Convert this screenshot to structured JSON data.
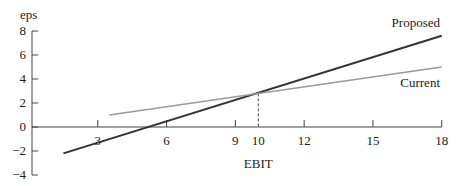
{
  "chart_data": {
    "type": "line",
    "title": "",
    "xlabel": "EBIT",
    "ylabel": "eps",
    "xlim": [
      0,
      18
    ],
    "ylim": [
      -4,
      8
    ],
    "xticks": [
      3,
      6,
      9,
      10,
      12,
      15,
      18
    ],
    "yticks": [
      -4,
      -2,
      0,
      2,
      4,
      6,
      8
    ],
    "grid": false,
    "series": [
      {
        "name": "Proposed",
        "color": "#333333",
        "x": [
          1.5,
          18
        ],
        "y": [
          -2.2,
          7.6
        ]
      },
      {
        "name": "Current",
        "color": "#9a9a9a",
        "x": [
          3.5,
          18
        ],
        "y": [
          1.0,
          5.0
        ]
      }
    ],
    "annotations": [
      {
        "type": "dashed-vertical",
        "x": 10,
        "y": 2.8,
        "note": "indifference point"
      }
    ]
  }
}
